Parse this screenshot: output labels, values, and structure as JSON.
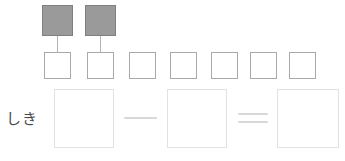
{
  "page": {
    "kind": "math-worksheet",
    "background_color": "#ffffff",
    "width": 345,
    "height": 161
  },
  "palette": {
    "tile_fill": "#9a9a9a",
    "tile_border": "#7f7f7f",
    "slot_border_small": "#a9a9a9",
    "slot_border_large": "#e2e2e2",
    "stem_color": "#b4b4b4",
    "operator_color": "#d8d8d8",
    "label_color": "#4a4a4a"
  },
  "counter_row": {
    "name": "filled-counter-row",
    "tiles": [
      {
        "id": "tile-1",
        "state": "filled",
        "x": 42,
        "y": 5,
        "size": 31
      },
      {
        "id": "tile-2",
        "state": "filled",
        "x": 85,
        "y": 5,
        "size": 31
      }
    ],
    "stems": [
      {
        "id": "stem-1",
        "x": 57,
        "y": 36,
        "height": 16
      },
      {
        "id": "stem-2",
        "x": 100,
        "y": 36,
        "height": 16
      }
    ]
  },
  "slot_row": {
    "name": "empty-slot-row",
    "count": 7,
    "slots": [
      {
        "id": "slot-1",
        "x": 44,
        "y": 52,
        "size": 27,
        "value": ""
      },
      {
        "id": "slot-2",
        "x": 87,
        "y": 52,
        "size": 27,
        "value": ""
      },
      {
        "id": "slot-3",
        "x": 129,
        "y": 52,
        "size": 27,
        "value": ""
      },
      {
        "id": "slot-4",
        "x": 170,
        "y": 52,
        "size": 27,
        "value": ""
      },
      {
        "id": "slot-5",
        "x": 211,
        "y": 52,
        "size": 27,
        "value": ""
      },
      {
        "id": "slot-6",
        "x": 250,
        "y": 52,
        "size": 27,
        "value": ""
      },
      {
        "id": "slot-7",
        "x": 289,
        "y": 52,
        "size": 27,
        "value": ""
      }
    ]
  },
  "equation_row": {
    "name": "equation-row",
    "label": "しき",
    "boxes": [
      {
        "id": "answer-box-minuend",
        "x": 54,
        "y": 89,
        "width": 60,
        "height": 59,
        "value": ""
      },
      {
        "id": "answer-box-subtrahend",
        "x": 167,
        "y": 89,
        "width": 60,
        "height": 59,
        "value": ""
      },
      {
        "id": "answer-box-result",
        "x": 277,
        "y": 89,
        "width": 62,
        "height": 59,
        "value": ""
      }
    ],
    "operators": [
      {
        "id": "operator-minus",
        "glyph": "−",
        "name": "minus-sign",
        "x": 124,
        "y": 117,
        "width": 33
      },
      {
        "id": "operator-equals",
        "glyph": "=",
        "name": "equals-sign",
        "x": 238,
        "y": 113,
        "width": 30
      }
    ]
  }
}
